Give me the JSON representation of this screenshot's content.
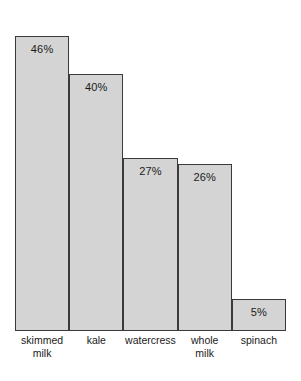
{
  "chart_data": {
    "type": "bar",
    "title": "",
    "subtitle": "",
    "xlabel": "",
    "ylabel": "",
    "ylim": [
      0,
      50
    ],
    "grid": false,
    "legend": false,
    "orientation": "vertical",
    "categories": [
      "skimmed\nmilk",
      "kale",
      "watercress",
      "whole\nmilk",
      "spinach"
    ],
    "values": [
      46,
      40,
      27,
      26,
      5
    ],
    "data_labels": [
      "46%",
      "40%",
      "27%",
      "26%",
      "5%"
    ],
    "bar_fill_color": "#d4d4d4",
    "bar_border_color": "#3a3a3a",
    "background_color": "#ffffff",
    "bars": [
      {
        "category": "skimmed\nmilk",
        "value": 46,
        "label": "46%"
      },
      {
        "category": "kale",
        "value": 40,
        "label": "40%"
      },
      {
        "category": "watercress",
        "value": 27,
        "label": "27%"
      },
      {
        "category": "whole\nmilk",
        "value": 26,
        "label": "26%"
      },
      {
        "category": "spinach",
        "value": 5,
        "label": "5%"
      }
    ]
  }
}
